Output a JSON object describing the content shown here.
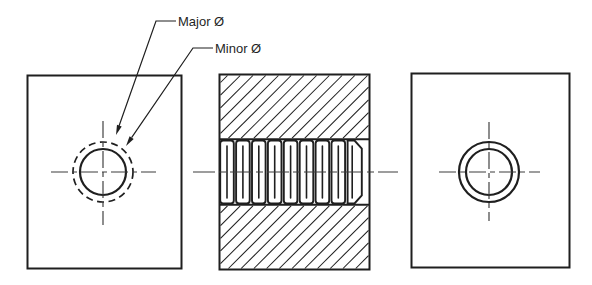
{
  "colors": {
    "background": "#ffffff",
    "line": "#1f1f1f",
    "centerline": "#3c3c3c",
    "text": "#1f1f1f"
  },
  "labels": {
    "major": "Major Ø",
    "minor": "Minor Ø",
    "diameter_symbol": "Ø"
  },
  "views": [
    {
      "id": "left-end-view",
      "name": "end view with major (dashed) and minor (solid) thread circles"
    },
    {
      "id": "section-view",
      "name": "hatched section view of internal thread"
    },
    {
      "id": "right-end-view",
      "name": "end view with chamfer and minor diameter circles"
    }
  ],
  "thread": {
    "cell_count": 8,
    "hatch_spacing": 9,
    "hatch_angle_deg": 45
  }
}
